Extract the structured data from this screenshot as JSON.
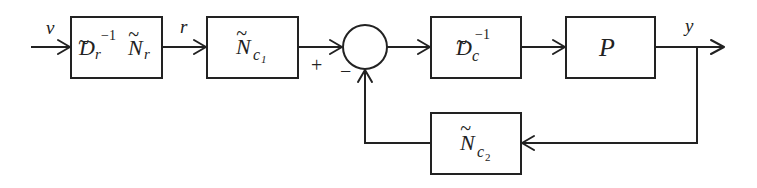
{
  "diagram": {
    "type": "feedback-control-block-diagram",
    "signals": {
      "input": "v",
      "reference": "r",
      "output": "y"
    },
    "blocks": [
      {
        "id": "prefilter",
        "base1": "D",
        "sub1": "r",
        "sup1": "−1",
        "base2": "N",
        "sub2": "r"
      },
      {
        "id": "feedforward",
        "base": "N",
        "sub": "c",
        "subsub": "1"
      },
      {
        "id": "controller-denominator",
        "base": "D",
        "sub": "c",
        "sup": "−1"
      },
      {
        "id": "plant",
        "label": "P"
      },
      {
        "id": "feedback",
        "base": "N",
        "sub": "c",
        "subsub": "2"
      }
    ],
    "tilde": "~",
    "summing_junction": {
      "plus_sign": "+",
      "minus_sign": "−"
    },
    "colors": {
      "stroke": "#222222",
      "background": "#ffffff"
    }
  }
}
